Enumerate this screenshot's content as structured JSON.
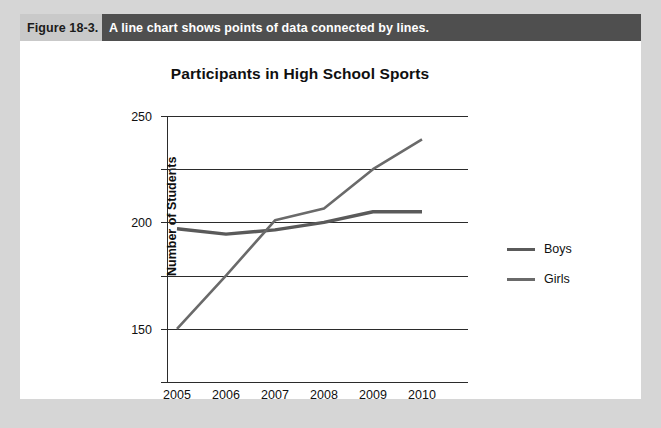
{
  "figure": {
    "label": "Figure 18-3.",
    "caption": "A line chart shows points of data connected by lines."
  },
  "legend": {
    "position": "right",
    "entries": [
      "Boys",
      "Girls"
    ]
  },
  "colors": {
    "frame": "#d6d6d6",
    "page": "#ffffff",
    "figure_label_bg": "#c9c9c9",
    "caption_bg": "#4f4f4f",
    "caption_fg": "#ffffff",
    "axis": "#2b2b2b",
    "series_boys": "#5a5a5a",
    "series_girls": "#6a6a6a",
    "text": "#101010"
  },
  "chart_data": {
    "type": "line",
    "title": "Participants in High School Sports",
    "xlabel": "",
    "ylabel": "Number of Students",
    "categories": [
      "2005",
      "2006",
      "2007",
      "2008",
      "2009",
      "2010"
    ],
    "yticks": [
      0,
      50,
      100,
      150,
      200,
      250
    ],
    "ylim": [
      0,
      250
    ],
    "grid": true,
    "legend_position": "right",
    "series": [
      {
        "name": "Boys",
        "values": [
          144,
          139,
          143,
          150,
          160,
          160
        ]
      },
      {
        "name": "Girls",
        "values": [
          50,
          100,
          152,
          163,
          200,
          228
        ]
      }
    ]
  }
}
